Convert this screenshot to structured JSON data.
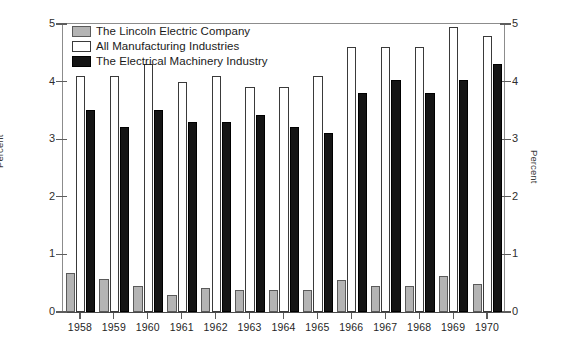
{
  "chart_data": {
    "type": "bar",
    "title": "",
    "subtitle": "",
    "xlabel": "",
    "ylabel": "Percent",
    "ylabel_right": "Percent",
    "ylim": [
      0,
      5
    ],
    "yticks": [
      0,
      1,
      2,
      3,
      4,
      5
    ],
    "ytick_labels": [
      "0",
      "1",
      "2",
      "3",
      "4",
      "5"
    ],
    "grid": false,
    "legend_position": "top-left",
    "categories": [
      "1958",
      "1959",
      "1960",
      "1961",
      "1962",
      "1963",
      "1964",
      "1965",
      "1966",
      "1967",
      "1968",
      "1969",
      "1970"
    ],
    "series": [
      {
        "name": "The Lincoln Electric Company",
        "color": "#b4b4b4",
        "values": [
          0.68,
          0.57,
          0.45,
          0.3,
          0.41,
          0.38,
          0.38,
          0.39,
          0.56,
          0.45,
          0.45,
          0.62,
          0.48
        ]
      },
      {
        "name": "All Manufacturing Industries",
        "color": "#ffffff",
        "values": [
          4.1,
          4.1,
          4.3,
          4.0,
          4.1,
          3.9,
          3.9,
          4.1,
          4.6,
          4.6,
          4.6,
          4.95,
          4.8
        ]
      },
      {
        "name": "The Electrical Machinery Industry",
        "color": "#141414",
        "values": [
          3.5,
          3.22,
          3.5,
          3.3,
          3.3,
          3.42,
          3.22,
          3.1,
          3.8,
          4.02,
          3.8,
          4.02,
          4.3
        ]
      }
    ]
  }
}
